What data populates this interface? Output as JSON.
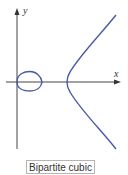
{
  "figure": {
    "caption": "Bipartite cubic",
    "x_axis_label": "x",
    "y_axis_label": "y",
    "curve_color": "#4a5aa8",
    "axis_color": "#444444"
  }
}
